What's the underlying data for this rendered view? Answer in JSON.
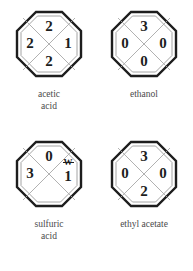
{
  "figure": {
    "type": "nfpa-704-hazard-symbols",
    "background_color": "#ffffff",
    "ink_color": "#1d1d1d",
    "caption_color": "#4a4a4a"
  },
  "symbols": [
    {
      "name": "acetic-acid",
      "caption_lines": [
        "acetic",
        "acid"
      ],
      "top": "2",
      "left": "2",
      "right": "1",
      "bottom": "2",
      "special": ""
    },
    {
      "name": "ethanol",
      "caption_lines": [
        "ethanol"
      ],
      "top": "3",
      "left": "0",
      "right": "0",
      "bottom": "0",
      "special": ""
    },
    {
      "name": "sulfuric-acid",
      "caption_lines": [
        "sulfuric",
        "acid"
      ],
      "top": "0",
      "left": "3",
      "right": "1",
      "bottom": "",
      "special": "W"
    },
    {
      "name": "ethyl-acetate",
      "caption_lines": [
        "ethyl acetate"
      ],
      "top": "3",
      "left": "0",
      "right": "0",
      "bottom": "2",
      "special": ""
    }
  ]
}
